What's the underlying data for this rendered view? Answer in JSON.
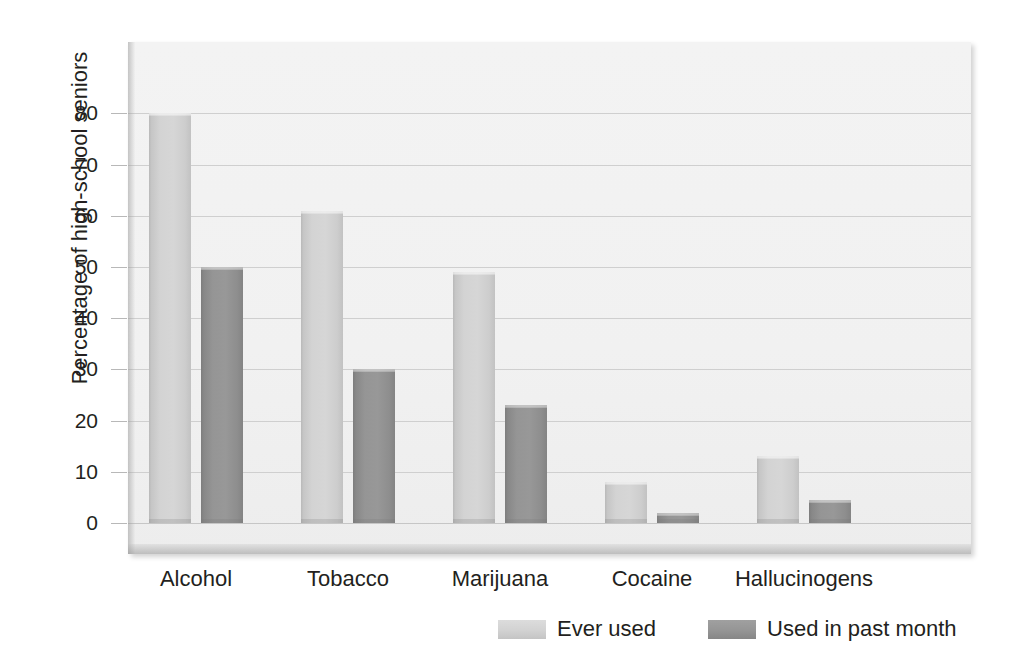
{
  "chart_data": {
    "type": "bar",
    "title": "",
    "xlabel": "",
    "ylabel": "Percentage of high-school seniors",
    "categories": [
      "Alcohol",
      "Tobacco",
      "Marijuana",
      "Cocaine",
      "Hallucinogens"
    ],
    "series": [
      {
        "name": "Ever used",
        "values": [
          80,
          61,
          49,
          8,
          13
        ],
        "color": "#d3d3d3"
      },
      {
        "name": "Used in past month",
        "values": [
          50,
          30,
          23,
          2,
          4.5
        ],
        "color": "#929292"
      }
    ],
    "ylim": [
      0,
      88
    ],
    "yticks": [
      0,
      10,
      20,
      30,
      40,
      50,
      60,
      70,
      80
    ],
    "ytick_labels": [
      "0",
      "10",
      "20",
      "30",
      "40",
      "50",
      "60",
      "70",
      "80"
    ],
    "grid": true,
    "legend_position": "bottom-right",
    "plot_background": "#f1f1f1",
    "gridline_color": "#cfcfcf"
  },
  "axis": {
    "y_title": "Percentage of high-school seniors"
  },
  "legend": {
    "entries": [
      {
        "label": "Ever used"
      },
      {
        "label": "Used in past month"
      }
    ]
  }
}
